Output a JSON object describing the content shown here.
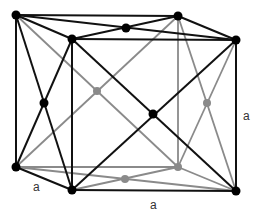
{
  "diagram": {
    "type": "face-centered and body-centered cubic lattice cell",
    "colors": {
      "front_edges": "#111111",
      "back_edges": "#8a8a8a",
      "front_atom": "#000000",
      "back_atom": "#8a8a8a"
    },
    "labels": [
      {
        "text": "a",
        "x": 33,
        "y": 181
      },
      {
        "text": "a",
        "x": 150,
        "y": 199
      },
      {
        "text": "a",
        "x": 243,
        "y": 110
      }
    ]
  }
}
